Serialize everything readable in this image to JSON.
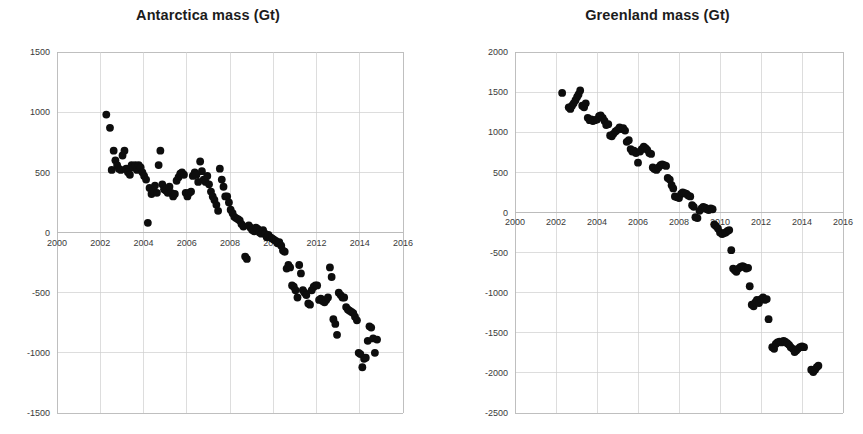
{
  "page": {
    "background_color": "#ffffff",
    "layout": "two-panel-scatter",
    "width": 863,
    "height": 434
  },
  "panels": [
    {
      "id": "antarctica",
      "title": "Antarctica mass (Gt)"
    },
    {
      "id": "greenland",
      "title": "Greenland mass (Gt)"
    }
  ],
  "chart_data": [
    {
      "type": "scatter",
      "title": "Antarctica mass (Gt)",
      "xlabel": "",
      "ylabel": "",
      "xlim": [
        2000,
        2016
      ],
      "ylim": [
        -1500,
        1500
      ],
      "xticks": [
        2000,
        2002,
        2004,
        2006,
        2008,
        2010,
        2012,
        2014,
        2016
      ],
      "xtick_labels": [
        "2000",
        "2002",
        "2004",
        "2006",
        "2008",
        "2010",
        "2012",
        "2014",
        "2016"
      ],
      "yticks": [
        1500,
        1000,
        500,
        0,
        -500,
        -1000,
        -1500
      ],
      "ytick_labels": [
        "1500",
        "1000",
        "500",
        "0",
        "-500",
        "-1000",
        "-1500"
      ],
      "grid": true,
      "legend": "none",
      "marker_color": "#0d0d0d",
      "marker_size": 5,
      "points": [
        [
          2002.28,
          980
        ],
        [
          2002.45,
          870
        ],
        [
          2002.53,
          520
        ],
        [
          2002.62,
          680
        ],
        [
          2002.7,
          600
        ],
        [
          2002.78,
          560
        ],
        [
          2002.86,
          530
        ],
        [
          2002.95,
          520
        ],
        [
          2003.03,
          640
        ],
        [
          2003.12,
          680
        ],
        [
          2003.2,
          530
        ],
        [
          2003.28,
          500
        ],
        [
          2003.37,
          480
        ],
        [
          2003.45,
          560
        ],
        [
          2003.53,
          540
        ],
        [
          2003.62,
          560
        ],
        [
          2003.7,
          520
        ],
        [
          2003.78,
          560
        ],
        [
          2003.87,
          540
        ],
        [
          2003.95,
          500
        ],
        [
          2004.03,
          470
        ],
        [
          2004.12,
          440
        ],
        [
          2004.2,
          80
        ],
        [
          2004.28,
          370
        ],
        [
          2004.37,
          320
        ],
        [
          2004.45,
          350
        ],
        [
          2004.53,
          390
        ],
        [
          2004.62,
          330
        ],
        [
          2004.7,
          560
        ],
        [
          2004.78,
          680
        ],
        [
          2004.87,
          400
        ],
        [
          2004.95,
          360
        ],
        [
          2005.03,
          350
        ],
        [
          2005.12,
          330
        ],
        [
          2005.2,
          380
        ],
        [
          2005.28,
          330
        ],
        [
          2005.37,
          300
        ],
        [
          2005.45,
          320
        ],
        [
          2005.53,
          430
        ],
        [
          2005.62,
          460
        ],
        [
          2005.7,
          490
        ],
        [
          2005.78,
          500
        ],
        [
          2005.87,
          480
        ],
        [
          2005.95,
          330
        ],
        [
          2006.03,
          300
        ],
        [
          2006.12,
          330
        ],
        [
          2006.2,
          340
        ],
        [
          2006.28,
          470
        ],
        [
          2006.37,
          500
        ],
        [
          2006.45,
          480
        ],
        [
          2006.53,
          420
        ],
        [
          2006.62,
          590
        ],
        [
          2006.7,
          510
        ],
        [
          2006.78,
          440
        ],
        [
          2006.87,
          420
        ],
        [
          2006.95,
          470
        ],
        [
          2007.03,
          400
        ],
        [
          2007.12,
          340
        ],
        [
          2007.2,
          300
        ],
        [
          2007.28,
          270
        ],
        [
          2007.37,
          230
        ],
        [
          2007.45,
          180
        ],
        [
          2007.53,
          530
        ],
        [
          2007.62,
          440
        ],
        [
          2007.7,
          380
        ],
        [
          2007.78,
          300
        ],
        [
          2007.87,
          300
        ],
        [
          2007.95,
          250
        ],
        [
          2008.03,
          190
        ],
        [
          2008.12,
          160
        ],
        [
          2008.2,
          130
        ],
        [
          2008.28,
          120
        ],
        [
          2008.37,
          110
        ],
        [
          2008.45,
          100
        ],
        [
          2008.53,
          70
        ],
        [
          2008.62,
          50
        ],
        [
          2008.7,
          -200
        ],
        [
          2008.78,
          -220
        ],
        [
          2008.87,
          60
        ],
        [
          2008.95,
          40
        ],
        [
          2009.03,
          20
        ],
        [
          2009.12,
          10
        ],
        [
          2009.2,
          40
        ],
        [
          2009.28,
          30
        ],
        [
          2009.37,
          0
        ],
        [
          2009.45,
          -10
        ],
        [
          2009.53,
          20
        ],
        [
          2009.62,
          -10
        ],
        [
          2009.7,
          -40
        ],
        [
          2009.78,
          -20
        ],
        [
          2009.87,
          -40
        ],
        [
          2009.95,
          -50
        ],
        [
          2010.03,
          -60
        ],
        [
          2010.12,
          -70
        ],
        [
          2010.2,
          -90
        ],
        [
          2010.28,
          -80
        ],
        [
          2010.37,
          -110
        ],
        [
          2010.45,
          -150
        ],
        [
          2010.53,
          -160
        ],
        [
          2010.62,
          -300
        ],
        [
          2010.7,
          -270
        ],
        [
          2010.78,
          -290
        ],
        [
          2010.87,
          -440
        ],
        [
          2010.95,
          -450
        ],
        [
          2011.03,
          -480
        ],
        [
          2011.12,
          -540
        ],
        [
          2011.2,
          -270
        ],
        [
          2011.28,
          -340
        ],
        [
          2011.37,
          -480
        ],
        [
          2011.45,
          -500
        ],
        [
          2011.53,
          -520
        ],
        [
          2011.62,
          -590
        ],
        [
          2011.7,
          -600
        ],
        [
          2011.78,
          -480
        ],
        [
          2011.87,
          -450
        ],
        [
          2011.95,
          -440
        ],
        [
          2012.03,
          -440
        ],
        [
          2012.12,
          -560
        ],
        [
          2012.2,
          -550
        ],
        [
          2012.28,
          -570
        ],
        [
          2012.37,
          -580
        ],
        [
          2012.45,
          -560
        ],
        [
          2012.53,
          -540
        ],
        [
          2012.62,
          -290
        ],
        [
          2012.7,
          -370
        ],
        [
          2012.78,
          -720
        ],
        [
          2012.87,
          -760
        ],
        [
          2012.95,
          -850
        ],
        [
          2013.03,
          -500
        ],
        [
          2013.12,
          -520
        ],
        [
          2013.2,
          -540
        ],
        [
          2013.28,
          -540
        ],
        [
          2013.37,
          -620
        ],
        [
          2013.45,
          -640
        ],
        [
          2013.53,
          -650
        ],
        [
          2013.62,
          -660
        ],
        [
          2013.7,
          -670
        ],
        [
          2013.78,
          -700
        ],
        [
          2013.87,
          -730
        ],
        [
          2013.95,
          -1000
        ],
        [
          2014.03,
          -1010
        ],
        [
          2014.12,
          -1120
        ],
        [
          2014.2,
          -1050
        ],
        [
          2014.28,
          -1040
        ],
        [
          2014.37,
          -900
        ],
        [
          2014.45,
          -780
        ],
        [
          2014.53,
          -790
        ],
        [
          2014.62,
          -880
        ],
        [
          2014.7,
          -1000
        ],
        [
          2014.8,
          -890
        ]
      ]
    },
    {
      "type": "scatter",
      "title": "Greenland mass (Gt)",
      "xlabel": "",
      "ylabel": "",
      "xlim": [
        2000,
        2016
      ],
      "ylim": [
        -2500,
        2000
      ],
      "xticks": [
        2000,
        2002,
        2004,
        2006,
        2008,
        2010,
        2012,
        2014,
        2016
      ],
      "xtick_labels": [
        "2000",
        "2002",
        "2004",
        "2006",
        "2008",
        "2010",
        "2012",
        "2014",
        "2016"
      ],
      "yticks": [
        2000,
        1500,
        1000,
        500,
        0,
        -500,
        -1000,
        -1500,
        -2000,
        -2500
      ],
      "ytick_labels": [
        "2000",
        "1500",
        "1000",
        "500",
        "0",
        "-500",
        "-1000",
        "-1500",
        "-2000",
        "-2500"
      ],
      "grid": true,
      "legend": "none",
      "marker_color": "#0d0d0d",
      "marker_size": 5,
      "points": [
        [
          2002.3,
          1490
        ],
        [
          2002.62,
          1310
        ],
        [
          2002.7,
          1290
        ],
        [
          2002.78,
          1330
        ],
        [
          2002.86,
          1360
        ],
        [
          2002.95,
          1400
        ],
        [
          2003.03,
          1440
        ],
        [
          2003.1,
          1470
        ],
        [
          2003.18,
          1520
        ],
        [
          2003.28,
          1330
        ],
        [
          2003.37,
          1310
        ],
        [
          2003.45,
          1360
        ],
        [
          2003.55,
          1180
        ],
        [
          2003.64,
          1150
        ],
        [
          2003.72,
          1160
        ],
        [
          2003.8,
          1140
        ],
        [
          2003.9,
          1150
        ],
        [
          2004.0,
          1160
        ],
        [
          2004.1,
          1200
        ],
        [
          2004.18,
          1210
        ],
        [
          2004.28,
          1180
        ],
        [
          2004.37,
          1140
        ],
        [
          2004.45,
          1090
        ],
        [
          2004.55,
          1100
        ],
        [
          2004.64,
          960
        ],
        [
          2004.72,
          950
        ],
        [
          2004.8,
          980
        ],
        [
          2004.9,
          1010
        ],
        [
          2005.0,
          1030
        ],
        [
          2005.1,
          1060
        ],
        [
          2005.18,
          1040
        ],
        [
          2005.28,
          1050
        ],
        [
          2005.37,
          1020
        ],
        [
          2005.45,
          880
        ],
        [
          2005.55,
          900
        ],
        [
          2005.64,
          790
        ],
        [
          2005.72,
          760
        ],
        [
          2005.8,
          770
        ],
        [
          2005.9,
          740
        ],
        [
          2006.0,
          620
        ],
        [
          2006.1,
          760
        ],
        [
          2006.18,
          790
        ],
        [
          2006.28,
          820
        ],
        [
          2006.37,
          800
        ],
        [
          2006.45,
          780
        ],
        [
          2006.55,
          740
        ],
        [
          2006.64,
          730
        ],
        [
          2006.72,
          560
        ],
        [
          2006.8,
          540
        ],
        [
          2006.9,
          530
        ],
        [
          2007.0,
          560
        ],
        [
          2007.1,
          590
        ],
        [
          2007.18,
          600
        ],
        [
          2007.28,
          590
        ],
        [
          2007.37,
          580
        ],
        [
          2007.45,
          430
        ],
        [
          2007.55,
          410
        ],
        [
          2007.64,
          340
        ],
        [
          2007.72,
          300
        ],
        [
          2007.8,
          200
        ],
        [
          2007.9,
          190
        ],
        [
          2008.0,
          180
        ],
        [
          2008.1,
          230
        ],
        [
          2008.18,
          250
        ],
        [
          2008.28,
          240
        ],
        [
          2008.37,
          230
        ],
        [
          2008.45,
          210
        ],
        [
          2008.55,
          200
        ],
        [
          2008.64,
          90
        ],
        [
          2008.72,
          70
        ],
        [
          2008.8,
          -60
        ],
        [
          2008.9,
          -70
        ],
        [
          2009.0,
          20
        ],
        [
          2009.1,
          50
        ],
        [
          2009.18,
          70
        ],
        [
          2009.28,
          60
        ],
        [
          2009.37,
          40
        ],
        [
          2009.45,
          30
        ],
        [
          2009.55,
          50
        ],
        [
          2009.64,
          40
        ],
        [
          2009.72,
          -150
        ],
        [
          2009.8,
          -170
        ],
        [
          2009.9,
          -200
        ],
        [
          2010.0,
          -250
        ],
        [
          2010.1,
          -270
        ],
        [
          2010.18,
          -260
        ],
        [
          2010.28,
          -250
        ],
        [
          2010.37,
          -230
        ],
        [
          2010.45,
          -220
        ],
        [
          2010.55,
          -470
        ],
        [
          2010.64,
          -700
        ],
        [
          2010.72,
          -720
        ],
        [
          2010.8,
          -740
        ],
        [
          2010.9,
          -700
        ],
        [
          2011.0,
          -680
        ],
        [
          2011.1,
          -670
        ],
        [
          2011.18,
          -680
        ],
        [
          2011.28,
          -700
        ],
        [
          2011.37,
          -690
        ],
        [
          2011.45,
          -920
        ],
        [
          2011.55,
          -1150
        ],
        [
          2011.64,
          -1170
        ],
        [
          2011.72,
          -1120
        ],
        [
          2011.8,
          -1090
        ],
        [
          2011.9,
          -1130
        ],
        [
          2012.0,
          -1080
        ],
        [
          2012.1,
          -1060
        ],
        [
          2012.18,
          -1090
        ],
        [
          2012.28,
          -1080
        ],
        [
          2012.37,
          -1330
        ],
        [
          2012.55,
          -1680
        ],
        [
          2012.64,
          -1700
        ],
        [
          2012.72,
          -1640
        ],
        [
          2012.8,
          -1620
        ],
        [
          2012.9,
          -1610
        ],
        [
          2013.0,
          -1620
        ],
        [
          2013.1,
          -1600
        ],
        [
          2013.18,
          -1610
        ],
        [
          2013.28,
          -1630
        ],
        [
          2013.37,
          -1650
        ],
        [
          2013.45,
          -1680
        ],
        [
          2013.55,
          -1700
        ],
        [
          2013.64,
          -1740
        ],
        [
          2013.72,
          -1720
        ],
        [
          2013.8,
          -1700
        ],
        [
          2013.9,
          -1680
        ],
        [
          2014.0,
          -1670
        ],
        [
          2014.1,
          -1680
        ],
        [
          2014.45,
          -1960
        ],
        [
          2014.55,
          -1990
        ],
        [
          2014.64,
          -1960
        ],
        [
          2014.72,
          -1930
        ],
        [
          2014.8,
          -1910
        ]
      ]
    }
  ]
}
